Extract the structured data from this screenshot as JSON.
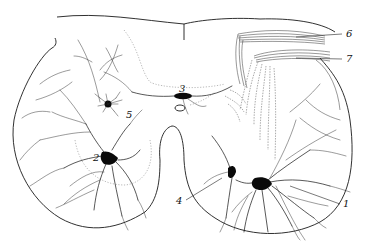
{
  "figure": {
    "labels": [
      {
        "id": "1",
        "text": "1",
        "x": 343,
        "y": 207
      },
      {
        "id": "2",
        "text": "2",
        "x": 93,
        "y": 161
      },
      {
        "id": "3",
        "text": "3",
        "x": 179,
        "y": 92
      },
      {
        "id": "4",
        "text": "4",
        "x": 176,
        "y": 204
      },
      {
        "id": "5",
        "text": "5",
        "x": 126,
        "y": 118
      },
      {
        "id": "6",
        "text": "6",
        "x": 346,
        "y": 37
      },
      {
        "id": "7",
        "text": "7",
        "x": 346,
        "y": 62
      }
    ],
    "colors": {
      "background": "#ffffff",
      "ink": "#111111"
    }
  }
}
